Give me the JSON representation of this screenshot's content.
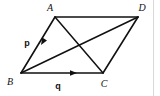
{
  "figure": {
    "background_color": "#ffffff",
    "stroke_color": "#111111",
    "divider_color": "#d9d9d9",
    "width": 160,
    "height": 96,
    "vertices": [
      {
        "id": "A",
        "label": "A",
        "x": 55,
        "y": 17,
        "label_x": 50,
        "label_y": 11
      },
      {
        "id": "D",
        "label": "D",
        "x": 138,
        "y": 17,
        "label_x": 142,
        "label_y": 11
      },
      {
        "id": "B",
        "label": "B",
        "x": 21,
        "y": 73,
        "label_x": 10,
        "label_y": 85
      },
      {
        "id": "C",
        "label": "C",
        "x": 103,
        "y": 73,
        "label_x": 104,
        "label_y": 87
      }
    ],
    "edges": [
      {
        "name": "edge-AD",
        "from": "A",
        "to": "D"
      },
      {
        "name": "edge-BC",
        "from": "B",
        "to": "C"
      },
      {
        "name": "edge-AB",
        "from": "A",
        "to": "B"
      },
      {
        "name": "edge-DC",
        "from": "D",
        "to": "C"
      }
    ],
    "diagonals": [
      {
        "name": "diagonal-AC",
        "from": "A",
        "to": "C"
      },
      {
        "name": "diagonal-BD",
        "from": "B",
        "to": "D"
      }
    ],
    "vectors": [
      {
        "id": "p",
        "label": "p",
        "from": "A",
        "to": "B",
        "label_x": 27,
        "label_y": 46,
        "arrow_x": 41,
        "arrow_y": 45,
        "arrow_angle_deg": 121
      },
      {
        "id": "q",
        "label": "q",
        "from": "B",
        "to": "C",
        "label_x": 58,
        "label_y": 89,
        "arrow_x": 77,
        "arrow_y": 73,
        "arrow_angle_deg": 0
      }
    ]
  }
}
